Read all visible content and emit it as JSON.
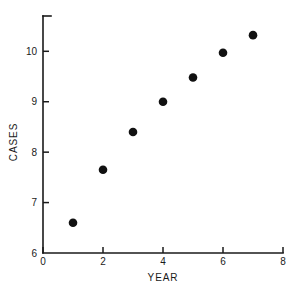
{
  "chart_data": {
    "type": "scatter",
    "title": "",
    "xlabel": "YEAR",
    "ylabel": "CASES",
    "x": [
      1,
      2,
      3,
      4,
      5,
      6,
      7
    ],
    "values": [
      6.6,
      7.65,
      8.4,
      9.0,
      9.48,
      9.97,
      10.32
    ],
    "points": [
      {
        "x": 1,
        "y": 6.6
      },
      {
        "x": 2,
        "y": 7.65
      },
      {
        "x": 3,
        "y": 8.4
      },
      {
        "x": 4,
        "y": 9.0
      },
      {
        "x": 5,
        "y": 9.48
      },
      {
        "x": 6,
        "y": 9.97
      },
      {
        "x": 7,
        "y": 10.32
      }
    ],
    "xlim": [
      0,
      8
    ],
    "ylim": [
      6,
      10.7
    ],
    "xticks": [
      0,
      2,
      4,
      6,
      8
    ],
    "xtick_labels": [
      "0",
      "2",
      "4",
      "6",
      "8"
    ],
    "yticks": [
      6,
      7,
      8,
      9,
      10
    ],
    "ytick_labels": [
      "6",
      "7",
      "8",
      "9",
      "10"
    ],
    "grid": false,
    "legend": null,
    "marker": "filled-circle",
    "marker_color": "#111111",
    "axis_color": "#1a1a1a",
    "background_color": "#ffffff"
  },
  "axes": {
    "x_title": "YEAR",
    "y_title": "CASES"
  }
}
